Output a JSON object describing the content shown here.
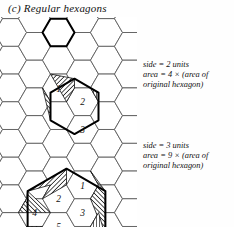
{
  "figure": {
    "label": "(c)",
    "title": "(c) Regular hexagons",
    "caption_text": "Regular hexagons",
    "type": "geometric-diagram",
    "colors": {
      "ink": "#111111",
      "grid_line": "#5a5a5a",
      "bold_line": "#000000",
      "hatch": "#222222",
      "paper": "#fefefe"
    }
  },
  "grid": {
    "name": "hexagonal-tiling",
    "orientation": "flat-top",
    "cell_width_px": 32,
    "cell_height_px": 28,
    "line_width_px": 0.9
  },
  "annotations": {
    "upper": {
      "line1": "side = 2 units",
      "line2": "area = 4 × (area of",
      "line3": "original hexagon)",
      "side_value": 2,
      "area_multiplier": 4
    },
    "lower": {
      "line1": "side = 3 units",
      "line2": "area = 9 × (area of",
      "line3": "original hexagon)",
      "side_value": 3,
      "area_multiplier": 9
    }
  },
  "clusters": {
    "original": {
      "name": "original-hexagon",
      "side_units": 1,
      "cell_count": 1,
      "labels": []
    },
    "upper": {
      "name": "side-2-hexagon",
      "side_units": 2,
      "cell_count": 3,
      "labels": [
        "1",
        "2",
        "3"
      ],
      "hatched_regions": 3
    },
    "lower": {
      "name": "side-3-hexagon",
      "side_units": 3,
      "cell_count": 6,
      "labels": [
        "1",
        "2",
        "3",
        "4",
        "5",
        "6"
      ],
      "hatched_regions": 3
    }
  },
  "cell_labels": {
    "upper": [
      {
        "id": "u1",
        "text": "1"
      },
      {
        "id": "u2",
        "text": "2"
      },
      {
        "id": "u3",
        "text": "3"
      }
    ],
    "lower": [
      {
        "id": "l1",
        "text": "1"
      },
      {
        "id": "l2",
        "text": "2"
      },
      {
        "id": "l3",
        "text": "3"
      },
      {
        "id": "l4",
        "text": "4"
      },
      {
        "id": "l5",
        "text": "5"
      },
      {
        "id": "l6",
        "text": "6"
      }
    ]
  }
}
